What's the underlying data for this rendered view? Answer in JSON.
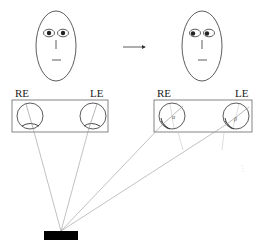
{
  "diagram": {
    "left_panel": {
      "right_eye_label": "RE",
      "left_eye_label": "LE"
    },
    "right_panel": {
      "right_eye_label": "RE",
      "left_eye_label": "LE",
      "right_eye_angle_label": "α",
      "left_eye_angle_label": "β"
    },
    "transition_arrow": "→",
    "colors": {
      "stroke": "#333333",
      "ray": "#999999",
      "target": "#000000"
    }
  }
}
